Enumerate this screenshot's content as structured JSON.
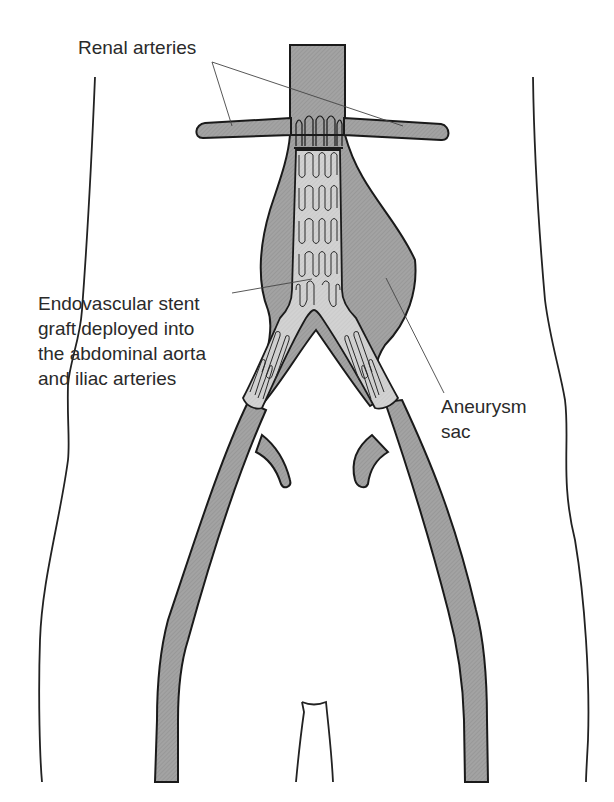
{
  "diagram": {
    "labels": {
      "renal_arteries": "Renal arteries",
      "stent_graft": [
        "Endovascular stent",
        "graft deployed into",
        "the abdominal aorta",
        "and iliac arteries"
      ],
      "aneurysm_sac": [
        "Aneurysm",
        "sac"
      ]
    },
    "colors": {
      "vessel_fill": "#9a9a9a",
      "graft_fill": "#cfcfcf",
      "outline": "#1a1a1a",
      "background": "#ffffff"
    }
  }
}
